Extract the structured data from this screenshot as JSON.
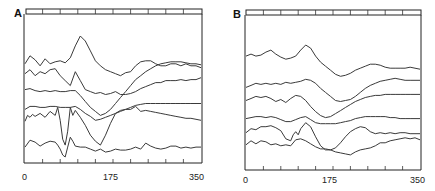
{
  "chart_data": [
    {
      "panel": "A",
      "type": "line",
      "title": "",
      "xlabel": "",
      "ylabel": "",
      "xlim": [
        0,
        350
      ],
      "x_ticks": [
        0,
        175,
        350
      ],
      "x_tick_labels": [
        "0",
        "175",
        "350"
      ],
      "minor_ticks_per_axis": 10,
      "grid": false,
      "legend": null,
      "series": [
        {
          "name": "trace-1",
          "x": [
            0,
            10,
            20,
            30,
            40,
            50,
            60,
            70,
            80,
            90,
            100,
            110,
            120,
            130,
            140,
            150,
            160,
            170,
            180,
            190,
            200,
            210,
            220,
            230,
            240,
            250,
            260,
            270,
            280,
            290,
            300,
            310,
            320,
            330,
            340,
            350
          ],
          "y": [
            0.72,
            0.8,
            0.76,
            0.7,
            0.77,
            0.72,
            0.74,
            0.75,
            0.73,
            0.78,
            0.9,
            1.0,
            0.95,
            0.85,
            0.75,
            0.7,
            0.66,
            0.64,
            0.62,
            0.6,
            0.63,
            0.64,
            0.7,
            0.74,
            0.75,
            0.75,
            0.72,
            0.7,
            0.7,
            0.72,
            0.72,
            0.7,
            0.72,
            0.7,
            0.7,
            0.68
          ]
        },
        {
          "name": "trace-2",
          "x": [
            0,
            10,
            20,
            30,
            40,
            50,
            60,
            70,
            80,
            90,
            100,
            110,
            120,
            130,
            140,
            150,
            160,
            170,
            180,
            190,
            200,
            210,
            220,
            230,
            240,
            250,
            260,
            270,
            280,
            290,
            300,
            310,
            320,
            330,
            340,
            350
          ],
          "y": [
            0.62,
            0.66,
            0.6,
            0.64,
            0.62,
            0.66,
            0.67,
            0.6,
            0.55,
            0.5,
            0.64,
            0.55,
            0.46,
            0.44,
            0.42,
            0.43,
            0.41,
            0.42,
            0.44,
            0.41,
            0.41,
            0.42,
            0.44,
            0.47,
            0.49,
            0.51,
            0.53,
            0.53,
            0.55,
            0.55,
            0.55,
            0.56,
            0.55,
            0.56,
            0.56,
            0.58
          ]
        },
        {
          "name": "trace-3",
          "x": [
            0,
            10,
            20,
            30,
            40,
            50,
            60,
            70,
            80,
            90,
            100,
            110,
            120,
            130,
            140,
            150,
            160,
            170,
            180,
            190,
            200,
            210,
            220,
            230,
            240,
            250,
            260,
            270,
            280,
            290,
            300,
            310,
            320,
            330,
            340,
            350
          ],
          "y": [
            0.46,
            0.47,
            0.45,
            0.44,
            0.45,
            0.44,
            0.45,
            0.44,
            0.44,
            0.45,
            0.45,
            0.4,
            0.34,
            0.28,
            0.24,
            0.2,
            0.22,
            0.26,
            0.32,
            0.38,
            0.44,
            0.5,
            0.56,
            0.6,
            0.64,
            0.67,
            0.7,
            0.72,
            0.73,
            0.74,
            0.74,
            0.74,
            0.73,
            0.72,
            0.72,
            0.71
          ]
        },
        {
          "name": "trace-4",
          "x": [
            0,
            10,
            20,
            30,
            40,
            50,
            60,
            70,
            80,
            90,
            100,
            110,
            120,
            130,
            140,
            150,
            160,
            170,
            180,
            190,
            200,
            210,
            220,
            230,
            240,
            250,
            260,
            270,
            280,
            290,
            300,
            310,
            320,
            330,
            340,
            350
          ],
          "y": [
            0.26,
            0.29,
            0.29,
            0.28,
            0.28,
            0.29,
            0.29,
            0.28,
            0.28,
            0.28,
            0.29,
            0.26,
            0.22,
            0.19,
            0.15,
            0.16,
            0.18,
            0.2,
            0.22,
            0.24,
            0.26,
            0.28,
            0.3,
            0.31,
            0.32,
            0.32,
            0.32,
            0.32,
            0.32,
            0.32,
            0.32,
            0.32,
            0.32,
            0.32,
            0.32,
            0.32
          ]
        },
        {
          "name": "trace-5",
          "x": [
            0,
            5,
            10,
            15,
            20,
            30,
            40,
            50,
            60,
            65,
            70,
            75,
            80,
            85,
            90,
            95,
            100,
            110,
            120,
            130,
            140,
            150,
            160,
            170,
            180,
            190,
            200,
            210,
            220,
            230,
            240,
            250,
            260,
            270,
            280,
            290,
            300,
            310,
            320,
            330,
            340,
            350
          ],
          "y": [
            0.14,
            0.2,
            0.18,
            0.21,
            0.19,
            0.22,
            0.18,
            0.24,
            0.2,
            0.28,
            0.15,
            -0.04,
            -0.1,
            0.04,
            0.28,
            0.2,
            0.25,
            0.18,
            0.1,
            0.0,
            -0.06,
            -0.1,
            0.0,
            0.12,
            0.22,
            0.25,
            0.26,
            0.26,
            0.29,
            0.24,
            0.25,
            0.24,
            0.23,
            0.22,
            0.21,
            0.2,
            0.19,
            0.18,
            0.17,
            0.17,
            0.16,
            0.15
          ]
        },
        {
          "name": "trace-6",
          "x": [
            0,
            10,
            20,
            30,
            40,
            50,
            60,
            65,
            70,
            75,
            80,
            85,
            90,
            95,
            100,
            110,
            120,
            130,
            140,
            150,
            160,
            170,
            180,
            190,
            200,
            210,
            220,
            230,
            240,
            250,
            260,
            270,
            280,
            290,
            300,
            310,
            320,
            330,
            340,
            350
          ],
          "y": [
            -0.12,
            -0.05,
            -0.07,
            -0.11,
            -0.08,
            -0.06,
            -0.07,
            -0.1,
            -0.14,
            -0.2,
            -0.22,
            -0.12,
            -0.02,
            -0.06,
            -0.11,
            -0.12,
            -0.12,
            -0.14,
            -0.16,
            -0.14,
            -0.17,
            -0.16,
            -0.14,
            -0.15,
            -0.15,
            -0.14,
            -0.12,
            -0.14,
            -0.08,
            -0.11,
            -0.13,
            -0.14,
            -0.13,
            -0.11,
            -0.11,
            -0.13,
            -0.12,
            -0.13,
            -0.12,
            -0.12
          ]
        }
      ]
    },
    {
      "panel": "B",
      "type": "line",
      "title": "",
      "xlabel": "",
      "ylabel": "",
      "xlim": [
        0,
        350
      ],
      "x_ticks": [
        0,
        175,
        350
      ],
      "x_tick_labels": [
        "0",
        "175",
        "350"
      ],
      "minor_ticks_per_axis": 10,
      "grid": false,
      "legend": null,
      "series": [
        {
          "name": "trace-1",
          "x": [
            0,
            10,
            20,
            30,
            40,
            50,
            60,
            70,
            80,
            90,
            100,
            110,
            120,
            130,
            140,
            150,
            160,
            170,
            180,
            190,
            200,
            210,
            220,
            230,
            240,
            250,
            260,
            270,
            280,
            290,
            300,
            310,
            320,
            330,
            340,
            350
          ],
          "y": [
            0.84,
            0.86,
            0.84,
            0.85,
            0.88,
            0.9,
            0.86,
            0.83,
            0.81,
            0.82,
            0.84,
            0.9,
            0.95,
            0.92,
            0.84,
            0.78,
            0.74,
            0.7,
            0.66,
            0.64,
            0.65,
            0.67,
            0.7,
            0.72,
            0.74,
            0.76,
            0.76,
            0.75,
            0.73,
            0.72,
            0.72,
            0.72,
            0.72,
            0.73,
            0.72,
            0.71
          ]
        },
        {
          "name": "trace-2",
          "x": [
            0,
            10,
            20,
            30,
            40,
            50,
            60,
            70,
            80,
            90,
            100,
            110,
            120,
            130,
            140,
            150,
            160,
            170,
            180,
            190,
            200,
            210,
            220,
            230,
            240,
            250,
            260,
            270,
            280,
            290,
            300,
            310,
            320,
            330,
            340,
            350
          ],
          "y": [
            0.53,
            0.55,
            0.57,
            0.56,
            0.57,
            0.56,
            0.57,
            0.56,
            0.58,
            0.57,
            0.58,
            0.59,
            0.61,
            0.6,
            0.57,
            0.52,
            0.48,
            0.44,
            0.4,
            0.39,
            0.4,
            0.41,
            0.44,
            0.48,
            0.52,
            0.55,
            0.57,
            0.59,
            0.6,
            0.61,
            0.62,
            0.61,
            0.6,
            0.6,
            0.6,
            0.6
          ]
        },
        {
          "name": "trace-3",
          "x": [
            0,
            10,
            20,
            30,
            40,
            50,
            60,
            70,
            80,
            90,
            100,
            110,
            120,
            130,
            140,
            150,
            160,
            170,
            180,
            190,
            200,
            210,
            220,
            230,
            240,
            250,
            260,
            270,
            280,
            290,
            300,
            310,
            320,
            330,
            340,
            350
          ],
          "y": [
            0.4,
            0.42,
            0.44,
            0.43,
            0.44,
            0.42,
            0.39,
            0.41,
            0.38,
            0.42,
            0.45,
            0.44,
            0.4,
            0.34,
            0.29,
            0.25,
            0.23,
            0.24,
            0.27,
            0.3,
            0.33,
            0.36,
            0.39,
            0.41,
            0.43,
            0.44,
            0.45,
            0.45,
            0.46,
            0.46,
            0.46,
            0.46,
            0.46,
            0.46,
            0.46,
            0.46
          ]
        },
        {
          "name": "trace-4",
          "x": [
            0,
            10,
            20,
            30,
            40,
            50,
            60,
            70,
            80,
            90,
            100,
            110,
            120,
            130,
            140,
            150,
            160,
            170,
            180,
            190,
            200,
            210,
            220,
            230,
            240,
            250,
            260,
            270,
            280,
            290,
            300,
            310,
            320,
            330,
            340,
            350
          ],
          "y": [
            0.22,
            0.23,
            0.24,
            0.24,
            0.23,
            0.24,
            0.23,
            0.21,
            0.19,
            0.19,
            0.21,
            0.23,
            0.24,
            0.21,
            0.18,
            0.17,
            0.17,
            0.17,
            0.17,
            0.18,
            0.19,
            0.2,
            0.22,
            0.23,
            0.24,
            0.24,
            0.24,
            0.24,
            0.24,
            0.23,
            0.23,
            0.22,
            0.22,
            0.22,
            0.22,
            0.22
          ]
        },
        {
          "name": "trace-5",
          "x": [
            0,
            10,
            20,
            30,
            40,
            50,
            60,
            70,
            80,
            90,
            95,
            100,
            105,
            110,
            120,
            130,
            140,
            150,
            160,
            170,
            180,
            190,
            200,
            210,
            220,
            230,
            240,
            250,
            260,
            270,
            280,
            290,
            300,
            310,
            320,
            330,
            340,
            350
          ],
          "y": [
            0.08,
            0.12,
            0.11,
            0.14,
            0.14,
            0.15,
            0.13,
            0.1,
            0.02,
            0.0,
            0.06,
            0.09,
            0.06,
            0.12,
            0.18,
            0.14,
            0.04,
            -0.05,
            -0.09,
            -0.09,
            -0.07,
            -0.02,
            0.04,
            0.09,
            0.12,
            0.14,
            0.13,
            0.09,
            0.07,
            0.08,
            0.07,
            0.08,
            0.07,
            0.08,
            0.08,
            0.07,
            0.07,
            0.07
          ]
        },
        {
          "name": "trace-6",
          "x": [
            0,
            10,
            20,
            30,
            40,
            50,
            60,
            70,
            80,
            90,
            100,
            110,
            120,
            130,
            140,
            150,
            160,
            170,
            180,
            190,
            200,
            210,
            220,
            230,
            240,
            250,
            260,
            270,
            280,
            290,
            300,
            310,
            320,
            330,
            340,
            350
          ],
          "y": [
            -0.04,
            0.0,
            -0.03,
            0.0,
            -0.01,
            -0.04,
            -0.03,
            -0.05,
            -0.04,
            -0.05,
            0.01,
            0.02,
            0.0,
            -0.03,
            -0.06,
            -0.08,
            -0.08,
            -0.09,
            -0.11,
            -0.12,
            -0.13,
            -0.14,
            -0.11,
            -0.09,
            -0.08,
            -0.07,
            -0.05,
            -0.02,
            -0.02,
            0.0,
            0.01,
            0.02,
            0.03,
            0.02,
            0.03,
            0.01
          ]
        }
      ]
    }
  ],
  "panels": {
    "A": {
      "label": "A",
      "x_labels": [
        "0",
        "175",
        "350"
      ]
    },
    "B": {
      "label": "B",
      "x_labels": [
        "0",
        "175",
        "350"
      ]
    }
  }
}
